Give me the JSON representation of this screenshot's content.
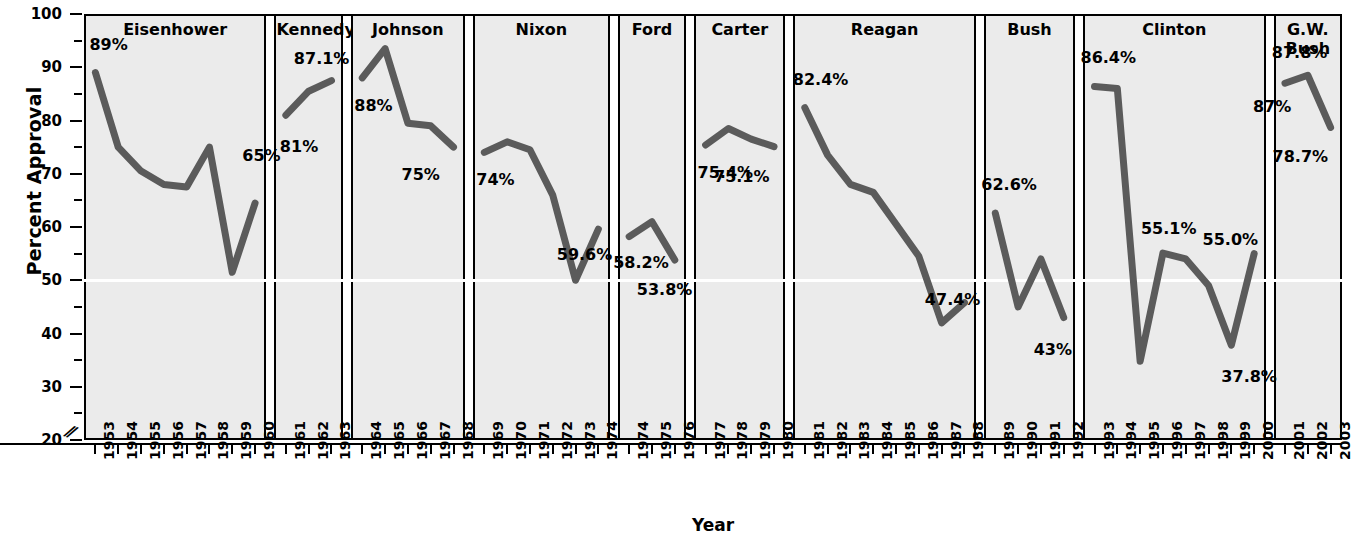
{
  "chart_data": {
    "type": "line",
    "title": "",
    "xlabel": "Year",
    "ylabel": "Percent Approval",
    "ylim": [
      20,
      100
    ],
    "ytick_major": [
      20,
      30,
      40,
      50,
      60,
      70,
      80,
      90,
      100
    ],
    "ytick_minor": [
      25,
      35,
      45,
      55,
      65,
      75,
      85,
      95
    ],
    "axis_break": true,
    "grid": false,
    "legend": "none",
    "reference_line": {
      "value": 50,
      "color": "#ffffff"
    },
    "line_color": "#5b5b5b",
    "panel_color": "#ebebeb",
    "panels": [
      {
        "name": "Eisenhower",
        "years": [
          1953,
          1954,
          1955,
          1956,
          1957,
          1958,
          1959,
          1960
        ],
        "values": [
          89.0,
          75.0,
          70.5,
          68.0,
          67.5,
          75.0,
          51.5,
          64.5
        ],
        "annotations": [
          {
            "text": "89%",
            "year": 1953,
            "value": 89.0,
            "dx": -6,
            "dy": -30
          },
          {
            "text": "65%",
            "year": 1959,
            "value": 51.5,
            "dx": 10,
            "dy": -118
          }
        ]
      },
      {
        "name": "Kennedy",
        "years": [
          1961,
          1962,
          1963
        ],
        "values": [
          81.0,
          85.5,
          87.5
        ],
        "annotations": [
          {
            "text": "87.1%",
            "year": 1961,
            "value": 81.0,
            "dx": 8,
            "dy": -58
          },
          {
            "text": "81%",
            "year": 1961,
            "value": 81.0,
            "dx": -6,
            "dy": 30
          }
        ]
      },
      {
        "name": "Johnson",
        "years": [
          1964,
          1965,
          1966,
          1967,
          1968
        ],
        "values": [
          88.0,
          93.5,
          79.5,
          79.0,
          75.0
        ],
        "annotations": [
          {
            "text": "88%",
            "year": 1964,
            "value": 88.0,
            "dx": -8,
            "dy": 26
          },
          {
            "text": "75%",
            "year": 1968,
            "value": 75.0,
            "dx": -52,
            "dy": 26
          }
        ]
      },
      {
        "name": "Nixon",
        "years": [
          1969,
          1970,
          1971,
          1972,
          1973,
          1974
        ],
        "values": [
          74.0,
          76.0,
          74.5,
          66.0,
          50.0,
          59.6
        ],
        "annotations": [
          {
            "text": "74%",
            "year": 1969,
            "value": 74.0,
            "dx": -8,
            "dy": 26
          },
          {
            "text": "59.6%",
            "year": 1972,
            "value": 66.0,
            "dx": 4,
            "dy": 58
          }
        ]
      },
      {
        "name": "Ford",
        "years": [
          1974,
          1975,
          1976
        ],
        "values": [
          58.2,
          61.0,
          53.8
        ],
        "annotations": [
          {
            "text": "58.2%",
            "year": 1974,
            "value": 58.2,
            "dx": -16,
            "dy": 24
          },
          {
            "text": "53.8%",
            "year": 1976,
            "value": 53.8,
            "dx": -38,
            "dy": 28
          }
        ]
      },
      {
        "name": "Carter",
        "years": [
          1977,
          1978,
          1979,
          1980
        ],
        "values": [
          75.4,
          78.5,
          76.5,
          75.1
        ],
        "annotations": [
          {
            "text": "75.4%",
            "year": 1977,
            "value": 75.4,
            "dx": -8,
            "dy": 26
          },
          {
            "text": "75.1%",
            "year": 1980,
            "value": 75.1,
            "dx": -60,
            "dy": 28
          }
        ]
      },
      {
        "name": "Reagan",
        "years": [
          1981,
          1982,
          1983,
          1984,
          1985,
          1986,
          1987,
          1988
        ],
        "values": [
          82.4,
          73.5,
          68.0,
          66.5,
          60.5,
          54.5,
          42.0,
          45.8
        ],
        "annotations": [
          {
            "text": "82.4%",
            "year": 1981,
            "value": 82.4,
            "dx": -12,
            "dy": -30
          },
          {
            "text": "47.4%",
            "year": 1986,
            "value": 54.5,
            "dx": 6,
            "dy": 42
          }
        ]
      },
      {
        "name": "Bush",
        "years": [
          1989,
          1990,
          1991,
          1992
        ],
        "values": [
          62.6,
          45.0,
          54.0,
          43.0
        ],
        "annotations": [
          {
            "text": "62.6%",
            "year": 1989,
            "value": 62.6,
            "dx": -14,
            "dy": -30
          },
          {
            "text": "43%",
            "year": 1992,
            "value": 43.0,
            "dx": -30,
            "dy": 30
          }
        ]
      },
      {
        "name": "Clinton",
        "years": [
          1993,
          1994,
          1995,
          1996,
          1997,
          1998,
          1999,
          2000
        ],
        "values": [
          86.4,
          86.0,
          34.8,
          55.1,
          54.0,
          49.0,
          37.8,
          55.0
        ],
        "annotations": [
          {
            "text": "86.4%",
            "year": 1993,
            "value": 86.4,
            "dx": -14,
            "dy": -30
          },
          {
            "text": "55.1%",
            "year": 1996,
            "value": 55.1,
            "dx": -22,
            "dy": -26
          },
          {
            "text": "55.0%",
            "year": 1998,
            "value": 49.0,
            "dx": -6,
            "dy": -48
          },
          {
            "text": "37.8%",
            "year": 1999,
            "value": 37.8,
            "dx": -10,
            "dy": 30
          }
        ]
      },
      {
        "name": "G.W.\nBush",
        "years": [
          2001,
          2002,
          2003
        ],
        "values": [
          87.0,
          88.5,
          78.7
        ],
        "annotations": [
          {
            "text": "87.8%",
            "year": 2002,
            "value": 88.5,
            "dx": -36,
            "dy": -24
          },
          {
            "text": "87%",
            "year": 2001,
            "value": 87.0,
            "dx": -32,
            "dy": 22
          },
          {
            "text": "78.7%",
            "year": 2003,
            "value": 78.7,
            "dx": -58,
            "dy": 28
          }
        ]
      }
    ]
  }
}
